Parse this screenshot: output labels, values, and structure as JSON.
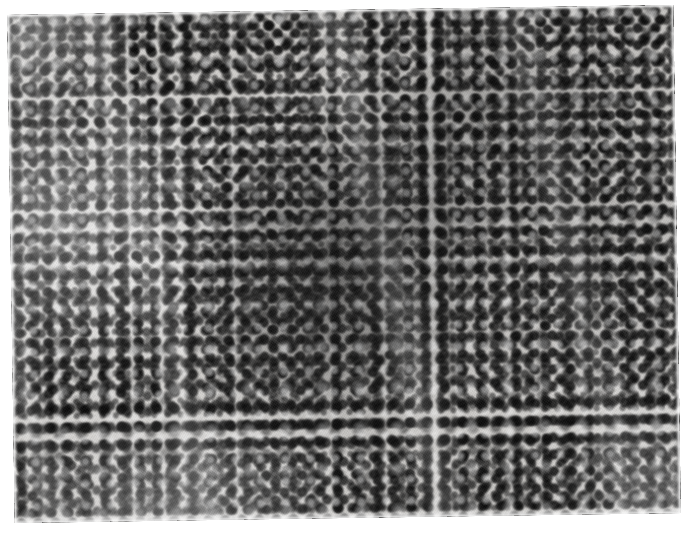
{
  "document": {
    "type": "photomicrograph",
    "title": "",
    "caption": "",
    "modality": "light microscopy, H&E stained histologic section",
    "rendering": "grayscale halftone photographic print",
    "background_color": "#ffffff"
  },
  "figure": {
    "name": "histopathology-micrograph",
    "print_edges": {
      "left_px": 11,
      "top_px": 10,
      "width_px": 666,
      "height_px": 508,
      "rotation_deg": -0.85
    },
    "tone": {
      "darkest": "#101010",
      "mid": "#6b6b6b",
      "lightest": "#f2f1ef",
      "page_white": "#ffffff"
    },
    "regions": [
      {
        "name": "dense-central-mass",
        "description": "Confluent sheet of small lymphocytes with hyperchromatic nuclei; minimal intervening pale cytoplasm.",
        "position": "center, slightly right of midline",
        "relative_density": "high"
      },
      {
        "name": "pale-left-field",
        "description": "Slightly less cellular field with larger, paler nuclei and more abundant clear cytoplasm between cells.",
        "position": "left third",
        "relative_density": "low"
      },
      {
        "name": "pale-lower-left-field",
        "description": "Paler, looser region toward the lower-left margin.",
        "position": "lower left",
        "relative_density": "low"
      },
      {
        "name": "right-field",
        "description": "Moderately dense lymphoid population similar to the centre but with more visible pale interstitial spaces.",
        "position": "right third",
        "relative_density": "medium"
      }
    ],
    "cell_features": {
      "predominant_cell": "small lymphocyte",
      "nucleus_shape": "round to slightly ovoid",
      "approx_nucleus_diameter_px": 13,
      "chromatin": "coarse, densely hyperchromatic",
      "cytoplasm": "scant, pale",
      "notable": "a few larger pale cells with open chromatin and a single small scattered vessel-like clearing near the lower centre"
    },
    "scale_bar": {
      "present": false,
      "label": ""
    },
    "labels": [],
    "annotations": []
  }
}
